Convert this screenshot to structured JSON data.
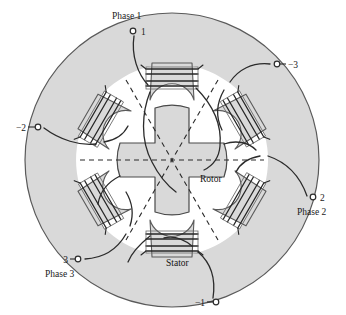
{
  "figure": {
    "background_color": "#ffffff",
    "iron_fill": "#d9d9d9",
    "iron_stroke": "#5a5a5a",
    "wire_stroke": "#2b2b2b",
    "dashed_stroke": "#2b2b2b",
    "center": {
      "x": 172,
      "y": 160
    },
    "stator_outer_radius": 147,
    "stator_inner_radius": 96,
    "rotor_radius": 40,
    "stator_pole_count": 6,
    "rotor_pole_count": 4,
    "axis_line_count": 3
  },
  "labels": {
    "rotor": "Rotor",
    "stator": "Stator",
    "phase1": "Phase 1",
    "phase2": "Phase 2",
    "phase3": "Phase 3",
    "terminal_1": "1",
    "terminal_minus_1": "−1",
    "terminal_2": "2",
    "terminal_minus_2": "−2",
    "terminal_3": "3",
    "terminal_minus_3": "−3"
  },
  "terminals": [
    {
      "name": "terminal-1",
      "label": "1",
      "phase": "Phase 1",
      "cx": 133,
      "cy": 31,
      "label_x": 141,
      "label_y": 35,
      "phase_x": 112,
      "phase_y": 19
    },
    {
      "name": "terminal-minus-3",
      "label": "−3",
      "phase": "",
      "cx": 277,
      "cy": 64,
      "label_x": 285,
      "label_y": 68,
      "phase_x": 0,
      "phase_y": 0
    },
    {
      "name": "terminal-minus-2",
      "label": "−2",
      "phase": "",
      "cx": 38,
      "cy": 127,
      "label_x": 17,
      "label_y": 131,
      "phase_x": 0,
      "phase_y": 0
    },
    {
      "name": "terminal-2",
      "label": "2",
      "phase": "Phase 2",
      "cx": 313,
      "cy": 197,
      "label_x": 321,
      "label_y": 201,
      "phase_x": 298,
      "phase_y": 214
    },
    {
      "name": "terminal-3",
      "label": "3",
      "phase": "Phase 3",
      "cx": 78,
      "cy": 259,
      "label_x": 62,
      "label_y": 263,
      "phase_x": 46,
      "phase_y": 276
    },
    {
      "name": "terminal-minus-1",
      "label": "−1",
      "phase": "",
      "cx": 216,
      "cy": 302,
      "label_x": 196,
      "label_y": 306,
      "phase_x": 0,
      "phase_y": 0
    }
  ],
  "inner_labels": [
    {
      "name": "rotor-label",
      "text": "Rotor",
      "x": 200,
      "y": 180
    },
    {
      "name": "stator-label",
      "text": "Stator",
      "x": 166,
      "y": 264
    }
  ]
}
